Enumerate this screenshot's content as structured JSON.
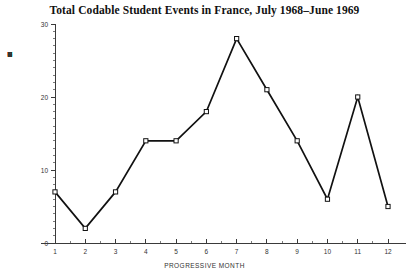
{
  "chart_data": {
    "type": "line",
    "title": "Total Codable Student Events in France, July 1968–June 1969",
    "xlabel": "PROGRESSIVE MONTH",
    "ylabel": "TOTAL STUDENT EVENTS",
    "categories": [
      "1",
      "2",
      "3",
      "4",
      "5",
      "6",
      "7",
      "8",
      "9",
      "10",
      "11",
      "12"
    ],
    "x": [
      1,
      2,
      3,
      4,
      5,
      6,
      7,
      8,
      9,
      10,
      11,
      12
    ],
    "values": [
      7,
      2,
      7,
      14,
      14,
      18,
      28,
      21,
      14,
      6,
      20,
      5
    ],
    "series": [
      {
        "name": "Total codable student events",
        "values": [
          7,
          2,
          7,
          14,
          14,
          18,
          28,
          21,
          14,
          6,
          20,
          5
        ]
      }
    ],
    "xlim": [
      1,
      12
    ],
    "ylim": [
      0,
      30
    ],
    "y_ticks": [
      0,
      10,
      20,
      30
    ],
    "y_tick_labels": [
      "0",
      "10",
      "20",
      "30"
    ],
    "y_minor_tick_step": 1,
    "x_ticks": [
      1,
      2,
      3,
      4,
      5,
      6,
      7,
      8,
      9,
      10,
      11,
      12
    ],
    "x_tick_labels": [
      "1",
      "2",
      "3",
      "4",
      "5",
      "6",
      "7",
      "8",
      "9",
      "10",
      "11",
      "12"
    ],
    "x_minor_tick_step": 0.5,
    "grid": false,
    "legend": false,
    "legend_position": "none",
    "marker": "open-square",
    "line_color": "#111111",
    "marker_fill": "#ffffff",
    "marker_stroke": "#111111",
    "axis_color": "#3a3a3a",
    "background_color": "#ffffff"
  },
  "y_axis_title_chars": [
    "T",
    "O",
    "T",
    "A",
    "L",
    "",
    "S",
    "T",
    "U",
    "D",
    "E",
    "N",
    "T",
    "",
    "E",
    "V",
    "E",
    "N",
    "T",
    "S"
  ]
}
